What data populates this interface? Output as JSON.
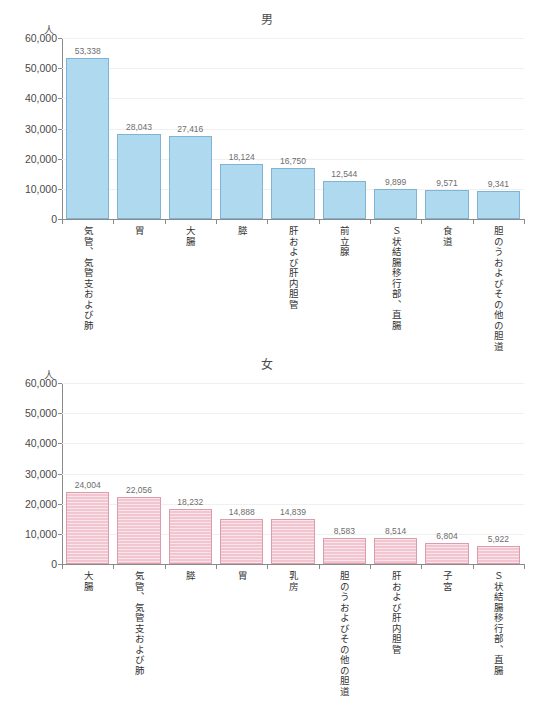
{
  "charts": [
    {
      "id": "male",
      "title": "男",
      "unit": "人",
      "color": "#aed9ee",
      "border_color": "#7fb4d4"
    },
    {
      "id": "female",
      "title": "女",
      "unit": "人",
      "color": "#f2c6d1",
      "border_color": "#dc9cad"
    }
  ],
  "chart_data": [
    {
      "type": "bar",
      "title": "男",
      "xlabel": "",
      "ylabel": "人",
      "ylim": [
        0,
        60000
      ],
      "yticks": [
        0,
        10000,
        20000,
        30000,
        40000,
        50000,
        60000
      ],
      "ytick_labels": [
        "0",
        "10,000",
        "20,000",
        "30,000",
        "40,000",
        "50,000",
        "60,000"
      ],
      "grid": true,
      "legend": "none",
      "categories": [
        "気管、気管支および肺",
        "胃",
        "大腸",
        "膵",
        "肝および肝内胆管",
        "前立腺",
        "Ｓ状結腸移行部、直腸",
        "食道",
        "胆のうおよびその他の胆道"
      ],
      "values": [
        53338,
        28043,
        27416,
        18124,
        16750,
        12544,
        9899,
        9571,
        9341
      ],
      "value_labels": [
        "53,338",
        "28,043",
        "27,416",
        "18,124",
        "16,750",
        "12,544",
        "9,899",
        "9,571",
        "9,341"
      ]
    },
    {
      "type": "bar",
      "title": "女",
      "xlabel": "",
      "ylabel": "人",
      "ylim": [
        0,
        60000
      ],
      "yticks": [
        0,
        10000,
        20000,
        30000,
        40000,
        50000,
        60000
      ],
      "ytick_labels": [
        "0",
        "10,000",
        "20,000",
        "30,000",
        "40,000",
        "50,000",
        "60,000"
      ],
      "grid": true,
      "legend": "none",
      "categories": [
        "大腸",
        "気管、気管支および肺",
        "膵",
        "胃",
        "乳房",
        "胆のうおよびその他の胆道",
        "肝および肝内胆管",
        "子宮",
        "Ｓ状結腸移行部、直腸"
      ],
      "values": [
        24004,
        22056,
        18232,
        14888,
        14839,
        8583,
        8514,
        6804,
        5922
      ],
      "value_labels": [
        "24,004",
        "22,056",
        "18,232",
        "14,888",
        "14,839",
        "8,583",
        "8,514",
        "6,804",
        "5,922"
      ]
    }
  ]
}
